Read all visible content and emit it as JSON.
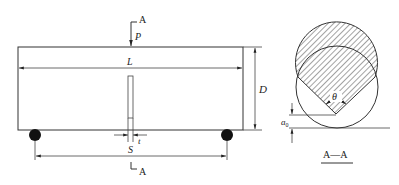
{
  "figure": {
    "colors": {
      "line": "#333333",
      "support": "#111111",
      "background": "#ffffff"
    }
  },
  "beam_view": {
    "section_marker_top": "A",
    "section_marker_bottom": "A",
    "load_label": "P",
    "span_label": "L",
    "depth_label": "D",
    "support_span_label": "S",
    "notch_width_label": "t"
  },
  "section_view": {
    "angle_label": "θ",
    "notch_depth_label": "a",
    "notch_depth_subscript": "0",
    "caption": "A—A"
  }
}
